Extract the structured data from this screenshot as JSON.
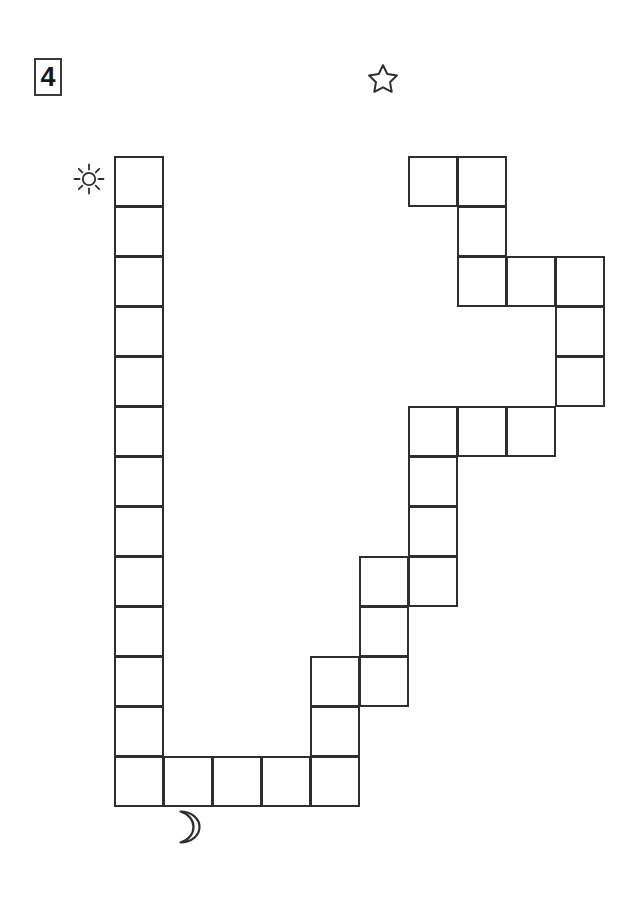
{
  "page": {
    "number": "4",
    "width": 640,
    "height": 900,
    "background_color": "#ffffff"
  },
  "maze": {
    "name": "sun-to-moon-path-maze",
    "line_color": "#2e2e2e",
    "cell_fill_color": "#ffffff",
    "cell_size": 49,
    "row_height": 50,
    "origin_x": 114,
    "origin_y": 156,
    "columns": 10,
    "rows": 13,
    "cells": [
      {
        "c": 0,
        "r": 0
      },
      {
        "c": 0,
        "r": 1
      },
      {
        "c": 0,
        "r": 2
      },
      {
        "c": 0,
        "r": 3
      },
      {
        "c": 0,
        "r": 4
      },
      {
        "c": 0,
        "r": 5
      },
      {
        "c": 0,
        "r": 6
      },
      {
        "c": 0,
        "r": 7
      },
      {
        "c": 0,
        "r": 8
      },
      {
        "c": 0,
        "r": 9
      },
      {
        "c": 0,
        "r": 10
      },
      {
        "c": 0,
        "r": 11
      },
      {
        "c": 0,
        "r": 12
      },
      {
        "c": 1,
        "r": 12
      },
      {
        "c": 2,
        "r": 12
      },
      {
        "c": 3,
        "r": 12
      },
      {
        "c": 4,
        "r": 12
      },
      {
        "c": 4,
        "r": 11
      },
      {
        "c": 4,
        "r": 10
      },
      {
        "c": 5,
        "r": 10
      },
      {
        "c": 5,
        "r": 9
      },
      {
        "c": 5,
        "r": 8
      },
      {
        "c": 6,
        "r": 8
      },
      {
        "c": 6,
        "r": 7
      },
      {
        "c": 6,
        "r": 6
      },
      {
        "c": 6,
        "r": 5
      },
      {
        "c": 7,
        "r": 5
      },
      {
        "c": 8,
        "r": 5
      },
      {
        "c": 9,
        "r": 4
      },
      {
        "c": 9,
        "r": 3
      },
      {
        "c": 9,
        "r": 2
      },
      {
        "c": 8,
        "r": 2
      },
      {
        "c": 7,
        "r": 2
      },
      {
        "c": 7,
        "r": 1
      },
      {
        "c": 7,
        "r": 0
      },
      {
        "c": 6,
        "r": 0
      }
    ]
  },
  "markers": {
    "start": {
      "icon": "sun-icon",
      "label": "sun",
      "color": "#2e2e2e",
      "x": 72,
      "y": 162
    },
    "branch": {
      "icon": "star-icon",
      "label": "star",
      "color": "#2e2e2e",
      "x": 366,
      "y": 62
    },
    "end": {
      "icon": "moon-icon",
      "label": "moon",
      "color": "#2e2e2e",
      "x": 168,
      "y": 808
    }
  }
}
